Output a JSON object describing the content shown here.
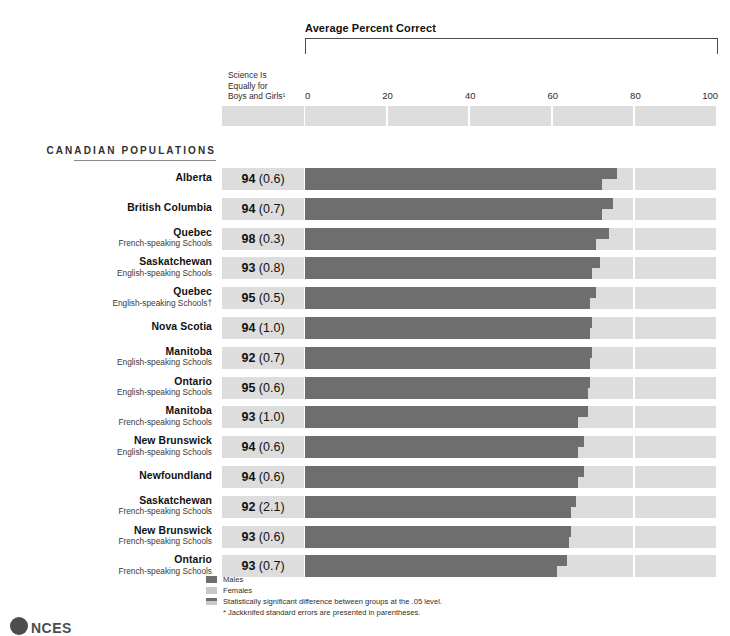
{
  "chart_data": {
    "type": "bar",
    "title": "Average Percent Correct",
    "subtitle": "Science Is Equally for Boys and Girls¹",
    "xlabel": "",
    "ylabel": "",
    "xlim": [
      0,
      100
    ],
    "tick_labels": [
      "0",
      "20",
      "40",
      "60",
      "80",
      "100"
    ],
    "tick_values": [
      0,
      20,
      40,
      60,
      80,
      100
    ],
    "grid": false,
    "legend_position": "bottom",
    "section_heading": "CANADIAN POPULATIONS",
    "series": [
      {
        "name": "Males",
        "key": "males"
      },
      {
        "name": "Females",
        "key": "females"
      }
    ],
    "categories": [
      "Alberta",
      "British Columbia",
      "Quebec French-speaking Schools",
      "Saskatchewan English-speaking Schools",
      "Quebec English-speaking Schools†",
      "Nova Scotia",
      "Manitoba English-speaking Schools",
      "Ontario English-speaking Schools",
      "Manitoba French-speaking Schools",
      "New Brunswick English-speaking Schools",
      "Newfoundland",
      "Saskatchewan French-speaking Schools",
      "New Brunswick French-speaking Schools",
      "Ontario French-speaking Schools"
    ],
    "rows": [
      {
        "name": "Alberta",
        "sub": "",
        "value": "94",
        "se": "(0.6)",
        "males": 75.5,
        "females": 72.0
      },
      {
        "name": "British Columbia",
        "sub": "",
        "value": "94",
        "se": "(0.7)",
        "males": 74.5,
        "females": 72.0
      },
      {
        "name": "Quebec",
        "sub": "French-speaking Schools",
        "value": "98",
        "se": "(0.3)",
        "males": 73.5,
        "females": 70.5
      },
      {
        "name": "Saskatchewan",
        "sub": "English-speaking Schools",
        "value": "93",
        "se": "(0.8)",
        "males": 71.5,
        "females": 69.5
      },
      {
        "name": "Quebec",
        "sub": "English-speaking Schools†",
        "value": "95",
        "se": "(0.5)",
        "males": 70.5,
        "females": 69.0
      },
      {
        "name": "Nova Scotia",
        "sub": "",
        "value": "94",
        "se": "(1.0)",
        "males": 69.5,
        "females": 69.0
      },
      {
        "name": "Manitoba",
        "sub": "English-speaking Schools",
        "value": "92",
        "se": "(0.7)",
        "males": 69.5,
        "females": 69.0
      },
      {
        "name": "Ontario",
        "sub": "English-speaking Schools",
        "value": "95",
        "se": "(0.6)",
        "males": 69.0,
        "females": 68.5
      },
      {
        "name": "Manitoba",
        "sub": "French-speaking Schools",
        "value": "93",
        "se": "(1.0)",
        "males": 68.5,
        "females": 66.0
      },
      {
        "name": "New Brunswick",
        "sub": "English-speaking Schools",
        "value": "94",
        "se": "(0.6)",
        "males": 67.5,
        "females": 66.0
      },
      {
        "name": "Newfoundland",
        "sub": "",
        "value": "94",
        "se": "(0.6)",
        "males": 67.5,
        "females": 66.0
      },
      {
        "name": "Saskatchewan",
        "sub": "French-speaking Schools",
        "value": "92",
        "se": "(2.1)",
        "males": 65.5,
        "females": 64.5
      },
      {
        "name": "New Brunswick",
        "sub": "French-speaking Schools",
        "value": "93",
        "se": "(0.6)",
        "males": 64.5,
        "females": 64.0
      },
      {
        "name": "Ontario",
        "sub": "French-speaking Schools",
        "value": "93",
        "se": "(0.7)",
        "males": 63.5,
        "females": 61.0
      }
    ],
    "legend": [
      {
        "swatch": "males",
        "label": "Males"
      },
      {
        "swatch": "females",
        "label": "Females"
      },
      {
        "swatch": "sig",
        "label": "Statistically significant difference between groups at the .05 level."
      }
    ],
    "footnote": {
      "marker": "*",
      "text": "Jackknifed standard errors are presented in parentheses."
    }
  },
  "header": {
    "title": "Average Percent Correct",
    "column_label_line1": "Science Is",
    "column_label_line2": "Equally for",
    "column_label_line3": "Boys and Girls¹"
  },
  "colors": {
    "bar_males": "#6e6e6e",
    "bar_females": "#c8c8c8",
    "track": "#dddddd",
    "stat_cell": "#dddddd",
    "text": "#111111"
  },
  "logo": {
    "text": "NCES"
  }
}
